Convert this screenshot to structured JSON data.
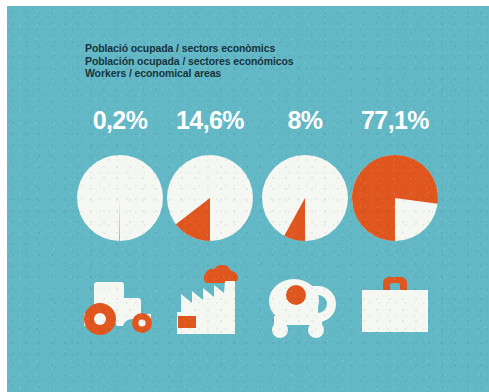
{
  "colors": {
    "background_teal": "#63b8c6",
    "accent_orange": "#e0561f",
    "figure_white": "#f4f7f2",
    "heading_text": "#16333b",
    "percent_text": "#ffffff",
    "page_white": "#ffffff"
  },
  "heading": {
    "line_catalan": "Població ocupada / sectors econòmics",
    "line_spanish": "Población ocupada / sectores económicos",
    "line_english": "Workers / economical areas"
  },
  "chart_data": {
    "type": "pie",
    "title": "Població ocupada / sectors econòmics",
    "subtitle": "Workers / economical areas",
    "legend": "none",
    "grid": false,
    "categories": [
      "Agriculture",
      "Industry",
      "Construction",
      "Services"
    ],
    "labels": [
      "0,2%",
      "14,6%",
      "8%",
      "77,1%"
    ],
    "values": [
      0.2,
      14.6,
      8.0,
      77.1
    ],
    "series": [
      {
        "name": "Share of employed population (%)",
        "values": [
          0.2,
          14.6,
          8.0,
          77.1
        ]
      }
    ],
    "units": "percent",
    "decimal_separator": ",",
    "slice_color": "#e0561f",
    "remainder_color": "#f4f7f2",
    "start_angle_deg": 180,
    "direction": "clockwise"
  },
  "sectors": [
    {
      "id": "agriculture",
      "percent_label": "0,2%",
      "value": 0.2,
      "icon": "tractor-icon",
      "center_x": 43
    },
    {
      "id": "industry",
      "percent_label": "14,6%",
      "value": 14.6,
      "icon": "factory-icon",
      "center_x": 133
    },
    {
      "id": "construction",
      "percent_label": "8%",
      "value": 8.0,
      "icon": "cement-mixer-icon",
      "center_x": 228
    },
    {
      "id": "services",
      "percent_label": "77,1%",
      "value": 77.1,
      "icon": "briefcase-icon",
      "center_x": 318
    }
  ]
}
